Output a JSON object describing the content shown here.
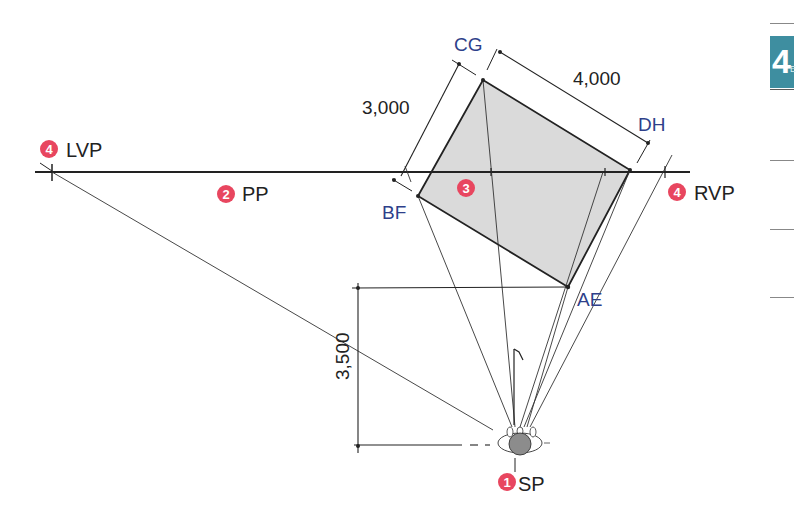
{
  "diagram": {
    "points": {
      "sp": {
        "marker": "1",
        "label": "SP"
      },
      "pp": {
        "marker": "2",
        "label": "PP"
      },
      "box": {
        "marker": "3"
      },
      "lvp": {
        "marker": "4",
        "label": "LVP"
      },
      "rvp": {
        "marker": "4",
        "label": "RVP"
      }
    },
    "corners": {
      "cg": "CG",
      "dh": "DH",
      "ae": "AE",
      "bf": "BF"
    },
    "dimensions": {
      "width": "3,000",
      "length": "4,000",
      "distance": "3,500"
    },
    "colors": {
      "marker": "#e8465f",
      "corner_label": "#2e3f8a",
      "fill": "#d9d9d9",
      "line": "#222222",
      "tab": "#3e8ea0"
    }
  },
  "side_tab": {
    "number": "4",
    "suffix": "E"
  }
}
